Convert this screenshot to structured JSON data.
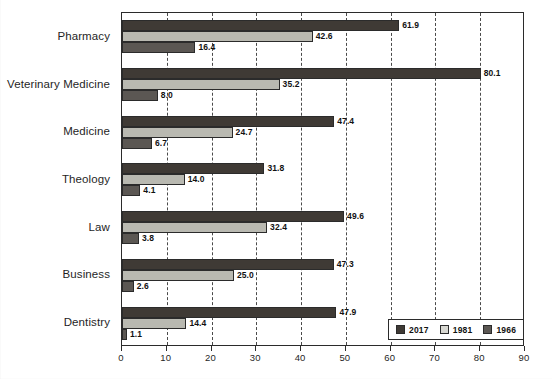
{
  "chart_data": {
    "type": "bar",
    "orientation": "horizontal",
    "title": "",
    "xlabel": "",
    "ylabel": "",
    "xlim": [
      0,
      90
    ],
    "xticks": [
      0,
      10,
      20,
      30,
      40,
      50,
      60,
      70,
      80,
      90
    ],
    "grid": true,
    "grid_style": "dashed-vertical",
    "legend_position": "bottom-right",
    "categories": [
      "Pharmacy",
      "Veterinary Medicine",
      "Medicine",
      "Theology",
      "Law",
      "Business",
      "Dentistry"
    ],
    "series": [
      {
        "name": "2017",
        "color": "#3f3a35",
        "values": [
          61.9,
          80.1,
          47.4,
          31.8,
          49.6,
          47.3,
          47.9
        ],
        "labels": [
          "61.9",
          "80.1",
          "47.4",
          "31.8",
          "49.6",
          "47.3",
          "47.9"
        ]
      },
      {
        "name": "1981",
        "color": "#b9b9b1",
        "values": [
          42.6,
          35.2,
          24.7,
          14.0,
          32.4,
          25.0,
          14.4
        ],
        "labels": [
          "42.6",
          "35.2",
          "24.7",
          "14.0",
          "32.4",
          "25.0",
          "14.4"
        ]
      },
      {
        "name": "1966",
        "color": "#5b5753",
        "values": [
          16.4,
          8.0,
          6.7,
          4.1,
          3.8,
          2.6,
          1.1
        ],
        "labels": [
          "16.4",
          "8.0",
          "6.7",
          "4.1",
          "3.8",
          "2.6",
          "1.1"
        ]
      }
    ]
  },
  "legend": {
    "items": [
      {
        "label": "2017"
      },
      {
        "label": "1981"
      },
      {
        "label": "1966"
      }
    ]
  },
  "axis": {
    "x_tick_labels": [
      "0",
      "10",
      "20",
      "30",
      "40",
      "50",
      "60",
      "70",
      "80",
      "90"
    ]
  }
}
